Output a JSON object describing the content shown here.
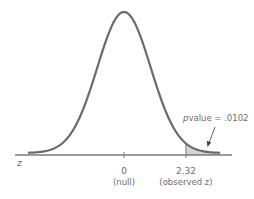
{
  "chart_data": {
    "type": "area",
    "title": "",
    "distribution": "standard normal",
    "mean": 0,
    "sd": 1,
    "xlim": [
      -3.6,
      3.6
    ],
    "xlabel": "z",
    "ylabel": "",
    "grid": false,
    "ticks": [
      {
        "value": 0,
        "label": "0",
        "sublabel": "(null)"
      },
      {
        "value": 2.32,
        "label": "2.32",
        "sublabel": "(observed z)"
      }
    ],
    "shaded_region": {
      "from": 2.32,
      "to": 3.6,
      "meaning": "upper tail area"
    },
    "annotation": {
      "prefix": "p",
      "text": "value = .0102",
      "p_value": 0.0102,
      "points_to": "shaded-tail"
    },
    "colors": {
      "curve": "#6b6b6b",
      "axis": "#7a7a7a",
      "shade": "#d3d3d3",
      "text": "#6e6e6e"
    }
  }
}
